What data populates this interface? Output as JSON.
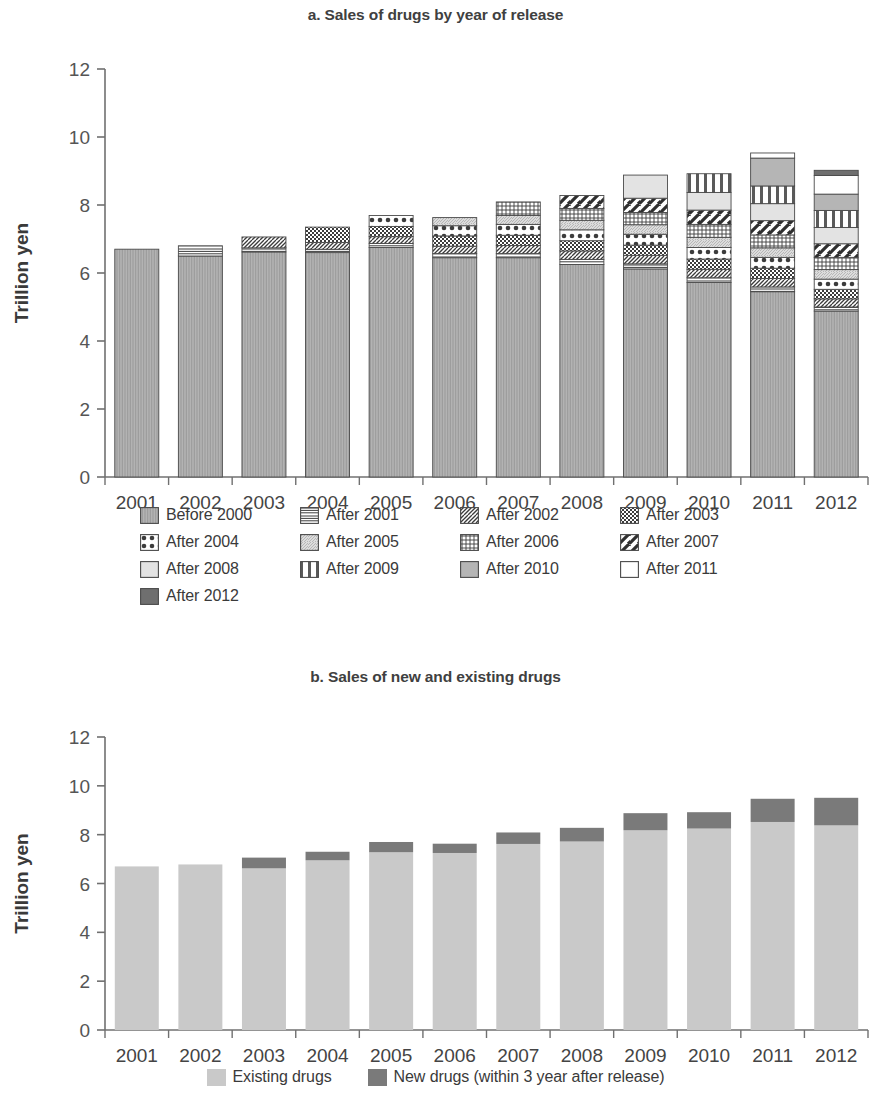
{
  "chart_data": [
    {
      "type": "bar",
      "id": "chart-a",
      "title": "a. Sales of drugs by year of release",
      "xlabel": "",
      "ylabel": "Trillion yen",
      "ylim": [
        0,
        12
      ],
      "yticks": [
        0,
        2,
        4,
        6,
        8,
        10,
        12
      ],
      "grid": false,
      "stacked": true,
      "legend_position": "bottom",
      "categories": [
        "2001",
        "2002",
        "2003",
        "2004",
        "2005",
        "2006",
        "2007",
        "2008",
        "2009",
        "2010",
        "2011",
        "2012"
      ],
      "series": [
        {
          "name": "Before 2000",
          "pattern": "vertical-fine",
          "values": [
            6.7,
            6.5,
            6.62,
            6.6,
            6.75,
            6.45,
            6.45,
            6.25,
            6.12,
            5.72,
            5.45,
            4.88
          ]
        },
        {
          "name": "After 2001",
          "pattern": "horizontal-lines",
          "values": [
            0.0,
            0.3,
            0.12,
            0.1,
            0.12,
            0.12,
            0.12,
            0.15,
            0.15,
            0.14,
            0.14,
            0.12
          ]
        },
        {
          "name": "After 2002",
          "pattern": "diagonal-stripes",
          "values": [
            0.0,
            0.0,
            0.32,
            0.2,
            0.2,
            0.22,
            0.24,
            0.25,
            0.25,
            0.25,
            0.25,
            0.24
          ]
        },
        {
          "name": "After 2003",
          "pattern": "checker",
          "values": [
            0.0,
            0.0,
            0.0,
            0.45,
            0.3,
            0.3,
            0.3,
            0.3,
            0.3,
            0.3,
            0.3,
            0.28
          ]
        },
        {
          "name": "After 2004",
          "pattern": "dots",
          "values": [
            0.0,
            0.0,
            0.0,
            0.0,
            0.32,
            0.3,
            0.32,
            0.32,
            0.32,
            0.34,
            0.32,
            0.3
          ]
        },
        {
          "name": "After 2005",
          "pattern": "light-hatch",
          "values": [
            0.0,
            0.0,
            0.0,
            0.0,
            0.0,
            0.24,
            0.26,
            0.28,
            0.28,
            0.3,
            0.28,
            0.28
          ]
        },
        {
          "name": "After 2006",
          "pattern": "grid",
          "values": [
            0.0,
            0.0,
            0.0,
            0.0,
            0.0,
            0.0,
            0.4,
            0.35,
            0.36,
            0.38,
            0.38,
            0.36
          ]
        },
        {
          "name": "After 2007",
          "pattern": "bold-diagonal",
          "values": [
            0.0,
            0.0,
            0.0,
            0.0,
            0.0,
            0.0,
            0.0,
            0.38,
            0.42,
            0.42,
            0.42,
            0.4
          ]
        },
        {
          "name": "After 2008",
          "pattern": "light-gray",
          "values": [
            0.0,
            0.0,
            0.0,
            0.0,
            0.0,
            0.0,
            0.0,
            0.0,
            0.68,
            0.52,
            0.5,
            0.48
          ]
        },
        {
          "name": "After 2009",
          "pattern": "vertical-bold",
          "values": [
            0.0,
            0.0,
            0.0,
            0.0,
            0.0,
            0.0,
            0.0,
            0.0,
            0.0,
            0.55,
            0.52,
            0.5
          ]
        },
        {
          "name": "After 2010",
          "pattern": "mid-gray",
          "values": [
            0.0,
            0.0,
            0.0,
            0.0,
            0.0,
            0.0,
            0.0,
            0.0,
            0.0,
            0.0,
            0.82,
            0.48
          ]
        },
        {
          "name": "After 2011",
          "pattern": "white",
          "values": [
            0.0,
            0.0,
            0.0,
            0.0,
            0.0,
            0.0,
            0.0,
            0.0,
            0.0,
            0.0,
            0.15,
            0.55
          ]
        },
        {
          "name": "After 2012",
          "pattern": "dark-gray",
          "values": [
            0.0,
            0.0,
            0.0,
            0.0,
            0.0,
            0.0,
            0.0,
            0.0,
            0.0,
            0.0,
            0.0,
            0.15
          ]
        }
      ],
      "totals": [
        6.7,
        6.8,
        7.06,
        7.35,
        7.69,
        7.63,
        8.09,
        8.28,
        8.88,
        8.92,
        9.53,
        9.52
      ]
    },
    {
      "type": "bar",
      "id": "chart-b",
      "title": "b. Sales of new and existing drugs",
      "xlabel": "",
      "ylabel": "Trillion yen",
      "ylim": [
        0,
        12
      ],
      "yticks": [
        0,
        2,
        4,
        6,
        8,
        10,
        12
      ],
      "grid": false,
      "stacked": true,
      "legend_position": "bottom",
      "categories": [
        "2001",
        "2002",
        "2003",
        "2004",
        "2005",
        "2006",
        "2007",
        "2008",
        "2009",
        "2010",
        "2011",
        "2012"
      ],
      "series": [
        {
          "name": "Existing drugs",
          "color": "#c9c9c9",
          "values": [
            6.7,
            6.78,
            6.62,
            6.95,
            7.28,
            7.25,
            7.62,
            7.72,
            8.18,
            8.25,
            8.52,
            8.38
          ]
        },
        {
          "name": "New drugs (within 3 year after release)",
          "color": "#7a7a7a",
          "values": [
            0.0,
            0.0,
            0.44,
            0.35,
            0.42,
            0.38,
            0.47,
            0.56,
            0.7,
            0.67,
            0.95,
            1.13
          ]
        }
      ],
      "totals": [
        6.7,
        6.78,
        7.06,
        7.3,
        7.7,
        7.63,
        8.09,
        8.28,
        8.88,
        8.92,
        9.47,
        9.51
      ]
    }
  ],
  "chart_a": {
    "title": "a. Sales of drugs by year of release",
    "ylabel": "Trillion yen",
    "yticks": [
      "12",
      "10",
      "8",
      "6",
      "4",
      "2",
      "0"
    ],
    "xticks": [
      "2001",
      "2002",
      "2003",
      "2004",
      "2005",
      "2006",
      "2007",
      "2008",
      "2009",
      "2010",
      "2011",
      "2012"
    ],
    "legend": [
      {
        "label": "Before 2000",
        "pattern": "vertical-fine"
      },
      {
        "label": "After 2001",
        "pattern": "horizontal-lines"
      },
      {
        "label": "After 2002",
        "pattern": "diagonal-stripes"
      },
      {
        "label": "After 2003",
        "pattern": "checker"
      },
      {
        "label": "After 2004",
        "pattern": "dots"
      },
      {
        "label": "After 2005",
        "pattern": "light-hatch"
      },
      {
        "label": "After 2006",
        "pattern": "grid"
      },
      {
        "label": "After 2007",
        "pattern": "bold-diagonal"
      },
      {
        "label": "After 2008",
        "pattern": "light-gray"
      },
      {
        "label": "After 2009",
        "pattern": "vertical-bold"
      },
      {
        "label": "After 2010",
        "pattern": "mid-gray"
      },
      {
        "label": "After 2011",
        "pattern": "white"
      },
      {
        "label": "After 2012",
        "pattern": "dark-gray"
      }
    ]
  },
  "chart_b": {
    "title": "b. Sales of new and existing drugs",
    "ylabel": "Trillion yen",
    "yticks": [
      "12",
      "10",
      "8",
      "6",
      "4",
      "2",
      "0"
    ],
    "xticks": [
      "2001",
      "2002",
      "2003",
      "2004",
      "2005",
      "2006",
      "2007",
      "2008",
      "2009",
      "2010",
      "2011",
      "2012"
    ],
    "legend": [
      {
        "label": "Existing drugs",
        "pattern": "light-gray-solid"
      },
      {
        "label": "New drugs (within 3 year after release)",
        "pattern": "dark-gray-solid"
      }
    ]
  },
  "colors": {
    "axis": "#707070",
    "text": "#3a3a3a",
    "existing": "#c9c9c9",
    "new": "#7a7a7a",
    "outline": "#4a4a4a"
  }
}
